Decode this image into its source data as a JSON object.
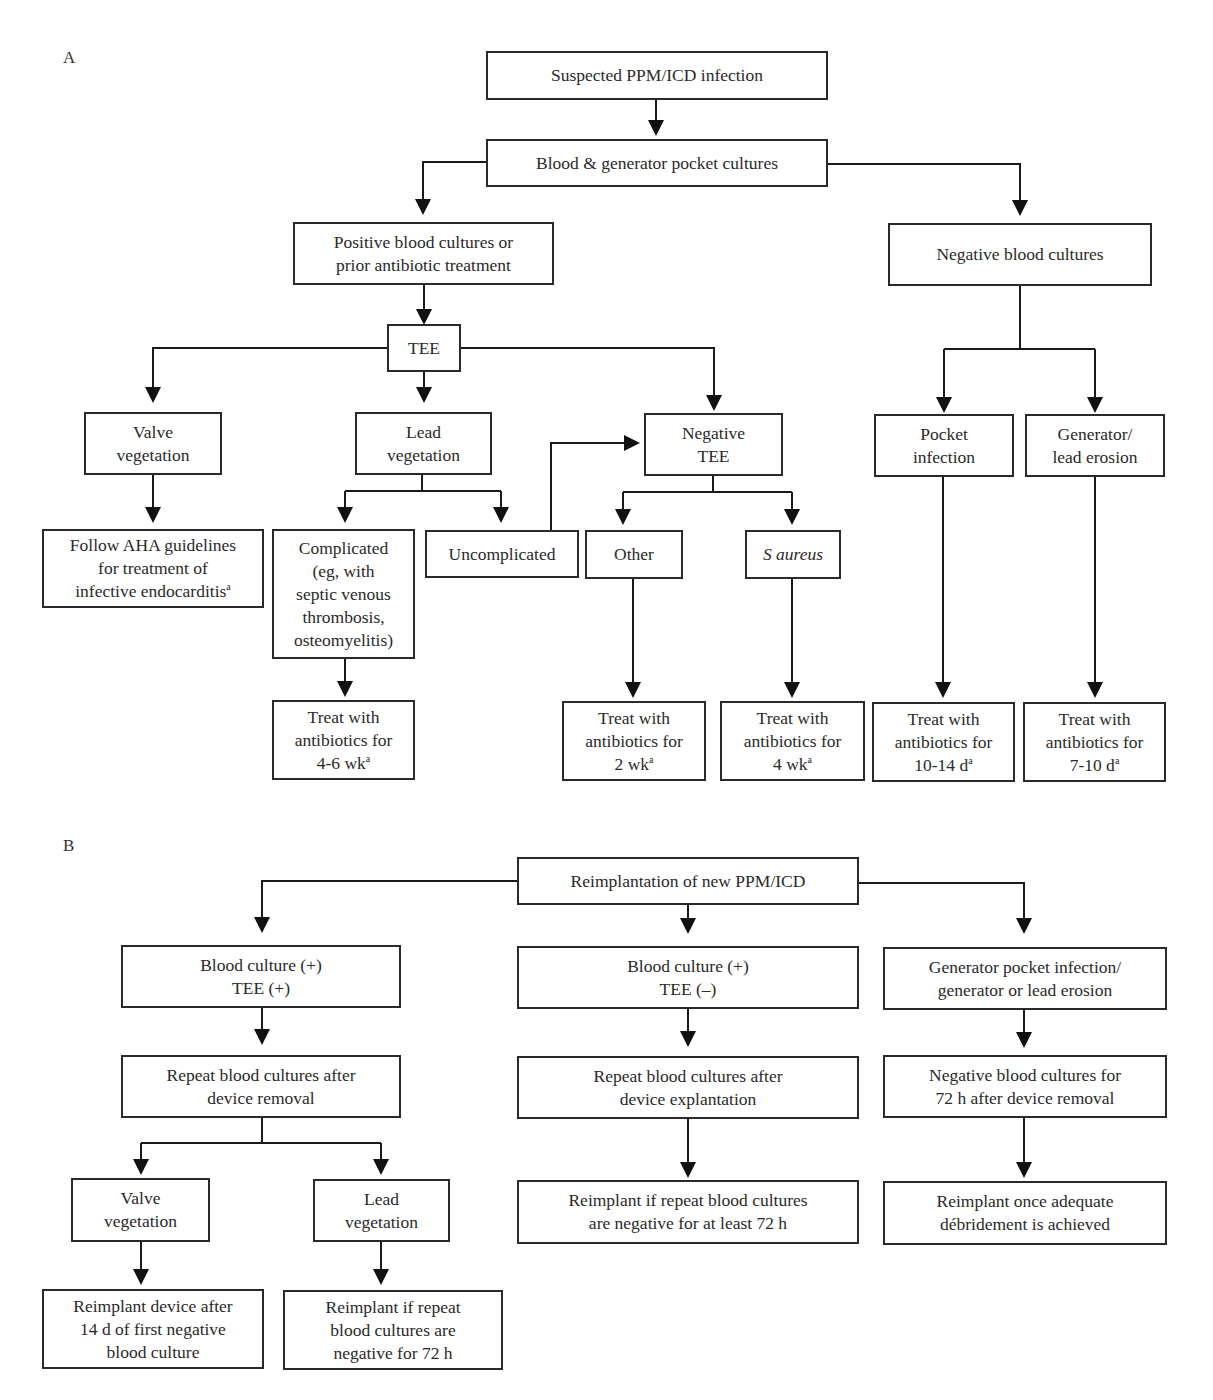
{
  "panels": {
    "a": {
      "label": "A",
      "nodes": {
        "suspected": "Suspected PPM/ICD infection",
        "cultures": "Blood & generator pocket cultures",
        "positive": "Positive blood cultures or\nprior antibiotic treatment",
        "negative_blood": "Negative blood cultures",
        "tee": "TEE",
        "valve_veg": "Valve\nvegetation",
        "lead_veg": "Lead\nvegetation",
        "negative_tee": "Negative\nTEE",
        "pocket_infection": "Pocket\ninfection",
        "gen_erosion": "Generator/\nlead erosion",
        "aha": "Follow AHA guidelines\nfor treatment of\ninfective endocarditis",
        "aha_sup": "a",
        "complicated": "Complicated\n(eg, with\nseptic venous\nthrombosis,\nosteomyelitis)",
        "uncomplicated": "Uncomplicated",
        "other": "Other",
        "saureus": "S aureus",
        "treat_4_6wk": "Treat with\nantibiotics for\n4-6 wk",
        "treat_2wk": "Treat with\nantibiotics for\n2 wk",
        "treat_4wk": "Treat with\nantibiotics for\n4 wk",
        "treat_10_14d": "Treat with\nantibiotics for\n10-14 d",
        "treat_7_10d": "Treat with\nantibiotics for\n7-10 d",
        "footnote_sup": "a"
      }
    },
    "b": {
      "label": "B",
      "nodes": {
        "reimplantation": "Reimplantation of new PPM/ICD",
        "bc_pos_tee_pos": "Blood culture (+)\nTEE (+)",
        "bc_pos_tee_neg": "Blood culture (+)\nTEE (–)",
        "gen_pocket": "Generator pocket infection/\ngenerator or lead erosion",
        "repeat_removal": "Repeat blood cultures after\ndevice removal",
        "repeat_explant": "Repeat blood cultures after\ndevice explantation",
        "neg_72h": "Negative blood cultures for\n72 h after device removal",
        "valve_veg": "Valve\nvegetation",
        "lead_veg": "Lead\nvegetation",
        "reimplant_72h_least": "Reimplant if repeat blood cultures\nare negative for at least 72 h",
        "reimplant_debridement": "Reimplant once adequate\ndébridement is achieved",
        "reimplant_14d": "Reimplant device after\n14 d of first negative\nblood culture",
        "reimplant_72h": "Reimplant if repeat\nblood cultures are\nnegative for 72 h"
      }
    }
  }
}
